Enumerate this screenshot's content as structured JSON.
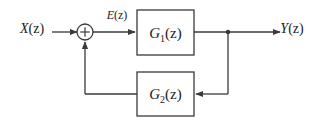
{
  "diagram": {
    "type": "feedback-control-block-diagram",
    "background_color": "#ffffff",
    "line_color": "#3a3a3a",
    "text_color": "#1a1a1a",
    "signals": {
      "input": {
        "label": "X(z)",
        "base": "X",
        "arg": "(z)",
        "x": 32,
        "y": 33
      },
      "error": {
        "label": "E(z)",
        "base": "E",
        "arg": "(z)",
        "x": 117,
        "y": 19
      },
      "output": {
        "label": "Y(z)",
        "base": "Y",
        "arg": "(z)",
        "x": 292,
        "y": 33
      }
    },
    "blocks": [
      {
        "name": "forward-gain-block",
        "label": "G1(z)",
        "base": "G",
        "subscript": "1",
        "arg": "(z)",
        "x": 137,
        "y": 10,
        "width": 57,
        "height": 45
      },
      {
        "name": "feedback-gain-block",
        "label": "G2(z)",
        "base": "G",
        "subscript": "2",
        "arg": "(z)",
        "x": 137,
        "y": 72,
        "width": 57,
        "height": 44
      }
    ],
    "summing_junction": {
      "name": "summing-junction",
      "symbol": "+",
      "cx": 85,
      "cy": 32,
      "r": 8
    },
    "takeoff_node": {
      "name": "output-takeoff-node",
      "cx": 228,
      "cy": 32,
      "r": 2.2
    },
    "paths": {
      "input_to_sum": "X(z) to summing junction",
      "sum_to_g1": "summing junction to G1(z), labeled E(z)",
      "g1_to_output": "G1(z) to Y(z) via takeoff node",
      "takeoff_to_g2": "takeoff node down and left into G2(z)",
      "g2_to_sum": "G2(z) left and up into summing junction"
    }
  }
}
